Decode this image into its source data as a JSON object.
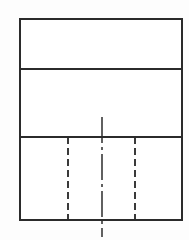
{
  "drawing": {
    "title": "Orthographic Multiview Line Drawing",
    "description": "Three stacked rectangular views with hidden lines and a vertical centerline",
    "background_color": "#fdfdfd",
    "line_color": "#2b2b2b",
    "hidden_line_color": "#3a3a3a",
    "center_line_color": "#3a3a3a",
    "canvas": {
      "width": 189,
      "height": 240
    },
    "outline": {
      "x": 20,
      "y": 19,
      "width": 162,
      "height": 201
    },
    "views": [
      {
        "name": "top-view",
        "label": "top view",
        "x": 20,
        "y": 19,
        "width": 162,
        "height": 50
      },
      {
        "name": "middle-view",
        "label": "middle view",
        "x": 20,
        "y": 69,
        "width": 162,
        "height": 68
      },
      {
        "name": "bottom-view",
        "label": "bottom view",
        "x": 20,
        "y": 137,
        "width": 162,
        "height": 83
      }
    ],
    "dividers": [
      {
        "name": "divider-upper",
        "x1": 20,
        "y1": 69,
        "x2": 182,
        "y2": 69
      },
      {
        "name": "divider-lower",
        "x1": 20,
        "y1": 137,
        "x2": 182,
        "y2": 137
      }
    ],
    "hidden_lines": [
      {
        "name": "hidden-line-left",
        "x1": 68,
        "y1": 137,
        "x2": 68,
        "y2": 220
      },
      {
        "name": "hidden-line-right",
        "x1": 135,
        "y1": 137,
        "x2": 135,
        "y2": 220
      }
    ],
    "center_lines": [
      {
        "name": "center-line-vertical",
        "x1": 102,
        "y1": 117,
        "x2": 102,
        "y2": 237
      }
    ]
  }
}
